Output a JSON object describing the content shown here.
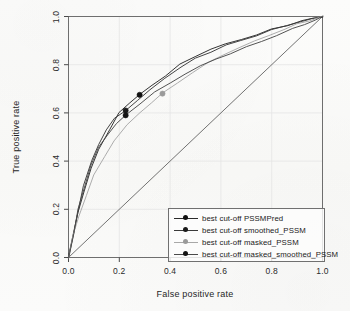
{
  "chart_data": {
    "type": "line",
    "title": "",
    "xlabel": "False positive rate",
    "ylabel": "True positive rate",
    "xlim": [
      0.0,
      1.0
    ],
    "ylim": [
      0.0,
      1.0
    ],
    "xticks": [
      "0.0",
      "0.2",
      "0.4",
      "0.6",
      "0.8",
      "1.0"
    ],
    "yticks": [
      "0.0",
      "0.2",
      "0.4",
      "0.6",
      "0.8",
      "1.0"
    ],
    "xtick_values": [
      0.0,
      0.2,
      0.4,
      0.6,
      0.8,
      1.0
    ],
    "ytick_values": [
      0.0,
      0.2,
      0.4,
      0.6,
      0.8,
      1.0
    ],
    "grid": true,
    "grid_color": "#e2e2e2",
    "legend_position": "bottom-right",
    "reference_line": {
      "name": "chance diagonal",
      "x": [
        0.0,
        1.0
      ],
      "y": [
        0.0,
        1.0
      ],
      "color": "#5a5a5a"
    },
    "series": [
      {
        "name": "best cut-off PSSMPred",
        "color": "#2a2a2a",
        "marker_color": "#111111",
        "cutoff_point": [
          0.28,
          0.675
        ],
        "x": [
          0.0,
          0.02,
          0.04,
          0.06,
          0.09,
          0.12,
          0.16,
          0.2,
          0.24,
          0.28,
          0.33,
          0.38,
          0.44,
          0.5,
          0.56,
          0.62,
          0.68,
          0.74,
          0.8,
          0.86,
          0.92,
          0.96,
          1.0
        ],
        "y": [
          0.0,
          0.1,
          0.19,
          0.27,
          0.37,
          0.45,
          0.53,
          0.6,
          0.645,
          0.675,
          0.715,
          0.755,
          0.8,
          0.835,
          0.865,
          0.885,
          0.905,
          0.925,
          0.945,
          0.965,
          0.982,
          0.991,
          1.0
        ]
      },
      {
        "name": "best cut-off smoothed_PSSM",
        "color": "#3a3a3a",
        "marker_color": "#1a1a1a",
        "cutoff_point": [
          0.225,
          0.61
        ],
        "x": [
          0.0,
          0.02,
          0.04,
          0.06,
          0.09,
          0.12,
          0.15,
          0.18,
          0.225,
          0.27,
          0.32,
          0.38,
          0.44,
          0.5,
          0.56,
          0.62,
          0.68,
          0.74,
          0.8,
          0.86,
          0.92,
          0.96,
          1.0
        ],
        "y": [
          0.0,
          0.11,
          0.21,
          0.3,
          0.4,
          0.47,
          0.53,
          0.575,
          0.61,
          0.65,
          0.695,
          0.745,
          0.79,
          0.825,
          0.855,
          0.88,
          0.9,
          0.922,
          0.943,
          0.963,
          0.981,
          0.99,
          1.0
        ]
      },
      {
        "name": "best cut-off masked_PSSM",
        "color": "#a8a8a8",
        "marker_color": "#9a9a9a",
        "cutoff_point": [
          0.37,
          0.68
        ],
        "x": [
          0.0,
          0.02,
          0.04,
          0.07,
          0.1,
          0.14,
          0.18,
          0.23,
          0.28,
          0.33,
          0.37,
          0.43,
          0.49,
          0.55,
          0.61,
          0.67,
          0.73,
          0.79,
          0.85,
          0.9,
          0.95,
          1.0
        ],
        "y": [
          0.0,
          0.09,
          0.17,
          0.26,
          0.34,
          0.42,
          0.485,
          0.55,
          0.6,
          0.645,
          0.68,
          0.725,
          0.768,
          0.808,
          0.842,
          0.87,
          0.897,
          0.922,
          0.948,
          0.967,
          0.985,
          1.0
        ]
      },
      {
        "name": "best cut-off masked_smoothed_PSSM",
        "color": "#4a4a4a",
        "marker_color": "#141414",
        "cutoff_point": [
          0.225,
          0.59
        ],
        "x": [
          0.0,
          0.02,
          0.04,
          0.06,
          0.09,
          0.12,
          0.155,
          0.19,
          0.225,
          0.28,
          0.34,
          0.4,
          0.46,
          0.52,
          0.58,
          0.64,
          0.7,
          0.76,
          0.82,
          0.88,
          0.93,
          0.97,
          1.0
        ],
        "y": [
          0.0,
          0.1,
          0.2,
          0.285,
          0.385,
          0.455,
          0.515,
          0.555,
          0.59,
          0.64,
          0.685,
          0.725,
          0.762,
          0.795,
          0.822,
          0.848,
          0.872,
          0.897,
          0.922,
          0.948,
          0.968,
          0.985,
          1.0
        ]
      }
    ]
  },
  "legend": {
    "entries": [
      {
        "label": "best cut-off PSSMPred"
      },
      {
        "label": "best cut-off smoothed_PSSM"
      },
      {
        "label": "best cut-off masked_PSSM"
      },
      {
        "label": "best cut-off masked_smoothed_PSSM"
      }
    ]
  },
  "axes": {
    "x_title": "False positive rate",
    "y_title": "True positive rate"
  }
}
